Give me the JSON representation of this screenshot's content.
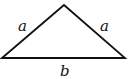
{
  "diagram": {
    "type": "isosceles-triangle",
    "vertices": {
      "apex": [
        64,
        5
      ],
      "base_left": [
        2,
        58
      ],
      "base_right": [
        125,
        58
      ]
    },
    "labels": {
      "left_side": "a",
      "right_side": "a",
      "base": "b"
    },
    "stroke_color": "#111111",
    "background": "#ffffff"
  }
}
